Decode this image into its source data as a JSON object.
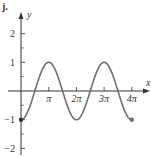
{
  "chart_data": {
    "type": "line",
    "title": "",
    "part_label": "j.",
    "xlabel": "x",
    "ylabel": "y",
    "function": "y = -cos(x)",
    "x_domain": [
      0,
      12.566370614359172
    ],
    "xlim": [
      0,
      13.4
    ],
    "ylim": [
      -2.3,
      2.6
    ],
    "x_ticks": [
      {
        "value": 3.141592653589793,
        "label": "π"
      },
      {
        "value": 6.283185307179586,
        "label": "2π"
      },
      {
        "value": 9.42477796076938,
        "label": "3π"
      },
      {
        "value": 12.566370614359172,
        "label": "4π"
      }
    ],
    "y_ticks": [
      {
        "value": 2,
        "label": "2"
      },
      {
        "value": 1,
        "label": "1"
      },
      {
        "value": -1,
        "label": "−1"
      },
      {
        "value": -2,
        "label": "−2"
      }
    ],
    "minor_y_ticks": [
      1.5,
      0.5,
      -0.5,
      -1.5
    ],
    "minor_x_ticks": [
      1.5707963267948966,
      4.71238898038469,
      7.853981633974483,
      10.995574287564276
    ],
    "endpoints": [
      {
        "x": 0,
        "y": -1,
        "label": "start"
      },
      {
        "x": 12.566370614359172,
        "y": -1,
        "label": "end"
      }
    ],
    "colors": {
      "curve": "#707070",
      "axis": "#333333"
    },
    "grid": false,
    "legend": "none"
  }
}
